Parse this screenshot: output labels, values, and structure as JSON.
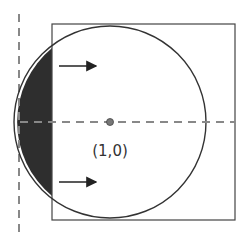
{
  "diagram": {
    "center_label": "(1,0)",
    "colors": {
      "stroke": "#333333",
      "dashed": "#888888",
      "shaded": "#2e2e2e",
      "center_dot": "#777777"
    },
    "elements": {
      "square": "square-boundary",
      "circle": "circle-unit",
      "shaded_region": "circle-outside-square-segment",
      "vertical_dashed_line": "vertical-dashed-axis",
      "horizontal_dashed_line": "horizontal-dashed-axis",
      "arrows": [
        "arrow-right-top",
        "arrow-right-bottom"
      ]
    }
  }
}
